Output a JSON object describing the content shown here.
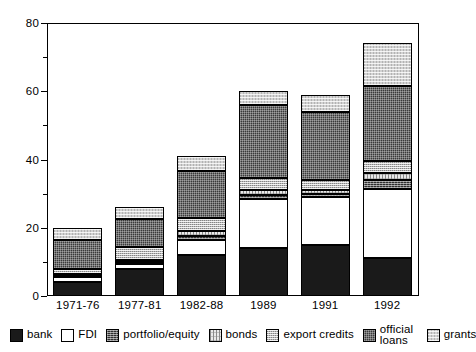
{
  "chart_data": {
    "type": "bar",
    "subtype": "stacked-bar",
    "title": "",
    "xlabel": "",
    "ylabel": "",
    "ylim": [
      0,
      80
    ],
    "yticks": [
      0,
      20,
      40,
      60,
      80
    ],
    "yminorticks": [
      10,
      30,
      50,
      70
    ],
    "grid": false,
    "legend_position": "bottom",
    "categories": [
      "1971-76",
      "1977-81",
      "1982-88",
      "1989",
      "1991",
      "1992"
    ],
    "series": [
      {
        "name": "bank",
        "values": [
          4.0,
          8.0,
          12.0,
          14.0,
          15.0,
          11.0
        ]
      },
      {
        "name": "FDI",
        "values": [
          1.5,
          1.5,
          4.5,
          14.5,
          14.0,
          20.5
        ]
      },
      {
        "name": "portfolio/equity",
        "values": [
          0.5,
          0.5,
          1.0,
          1.0,
          1.0,
          2.5
        ]
      },
      {
        "name": "bonds",
        "values": [
          0.5,
          0.5,
          1.5,
          1.5,
          1.0,
          2.0
        ]
      },
      {
        "name": "export credits",
        "values": [
          1.5,
          4.0,
          4.0,
          3.5,
          3.0,
          3.5
        ]
      },
      {
        "name": "official loans",
        "values": [
          8.5,
          8.0,
          13.5,
          21.5,
          20.0,
          22.0
        ]
      },
      {
        "name": "grants",
        "values": [
          3.5,
          3.5,
          4.5,
          4.0,
          5.0,
          12.5
        ]
      }
    ],
    "totals": [
      20.0,
      26.0,
      41.0,
      60.0,
      59.0,
      74.0
    ]
  },
  "axes": {
    "y": {
      "ticks": [
        {
          "value": 80,
          "label": "80",
          "minor": false
        },
        {
          "value": 70,
          "label": "",
          "minor": true
        },
        {
          "value": 60,
          "label": "60",
          "minor": false
        },
        {
          "value": 50,
          "label": "",
          "minor": true
        },
        {
          "value": 40,
          "label": "40",
          "minor": false
        },
        {
          "value": 30,
          "label": "",
          "minor": true
        },
        {
          "value": 20,
          "label": "20",
          "minor": false
        },
        {
          "value": 10,
          "label": "",
          "minor": true
        },
        {
          "value": 0,
          "label": "0",
          "minor": false
        }
      ]
    },
    "x": {
      "labels": [
        "1971-76",
        "1977-81",
        "1982-88",
        "1989",
        "1991",
        "1992"
      ]
    }
  },
  "legend": {
    "items": [
      {
        "label": "bank",
        "swatch": "f-bank",
        "two_line": false
      },
      {
        "label": "FDI",
        "swatch": "f-fdi",
        "two_line": false
      },
      {
        "label": "portfolio/equity",
        "swatch": "f-portfolio",
        "two_line": false
      },
      {
        "label": "bonds",
        "swatch": "f-bonds",
        "two_line": false
      },
      {
        "label": "export credits",
        "swatch": "f-export",
        "two_line": false
      },
      {
        "label": "official loans",
        "swatch": "f-official",
        "two_line": true
      },
      {
        "label": "grants",
        "swatch": "f-grants",
        "two_line": false
      }
    ]
  },
  "colors": {
    "bank": "#1a1a1a",
    "fdi": "#ffffff",
    "portfolio_equity": "#2e2e2e",
    "bonds": "#e9e9e9",
    "export_credits": "#b9b9b9",
    "official_loans": "#3a3a3a",
    "grants": "#d2d2d2",
    "axis": "#000000",
    "background": "#ffffff"
  }
}
